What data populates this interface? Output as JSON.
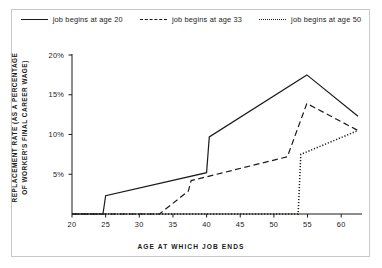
{
  "chart_data": {
    "type": "line",
    "title": "",
    "xlabel": "AGE AT WHICH JOB ENDS",
    "ylabel": "REPLACEMENT RATE (AS A PERCENTAGE OF WORKER'S FINAL CAREER WAGE)",
    "ylabel_line1": "REPLACEMENT RATE (AS A PERCENTAGE",
    "ylabel_line2": "OF WORKER'S FINAL CAREER WAGE)",
    "xlim": [
      20,
      62.5
    ],
    "ylim": [
      0,
      20
    ],
    "grid": false,
    "legend_position": "top-center",
    "xticks": [
      20,
      25,
      30,
      35,
      40,
      45,
      50,
      55,
      60
    ],
    "xtick_labels": [
      "20",
      "25",
      "30",
      "35",
      "40",
      "45",
      "50",
      "55",
      "60"
    ],
    "yticks": [
      5,
      10,
      15,
      20
    ],
    "ytick_labels": [
      "5%",
      "10%",
      "15%",
      "20%"
    ],
    "series": [
      {
        "name": "job begins at age 20",
        "style": "solid",
        "color": "#1a1a1a",
        "points": [
          [
            20,
            0
          ],
          [
            24.6,
            0
          ],
          [
            25.0,
            2.3
          ],
          [
            40.0,
            5.2
          ],
          [
            40.4,
            9.7
          ],
          [
            54.9,
            17.5
          ],
          [
            62.5,
            12.3
          ]
        ]
      },
      {
        "name": "job begins at age 33",
        "style": "dashed",
        "color": "#1a1a1a",
        "points": [
          [
            20,
            0
          ],
          [
            33.0,
            0
          ],
          [
            37.3,
            2.9
          ],
          [
            37.7,
            4.2
          ],
          [
            52.0,
            7.2
          ],
          [
            54.9,
            13.9
          ],
          [
            62.5,
            10.5
          ]
        ]
      },
      {
        "name": "job begins at age 50",
        "style": "dotted",
        "color": "#1a1a1a",
        "points": [
          [
            20,
            0
          ],
          [
            53.6,
            0
          ],
          [
            54.0,
            7.5
          ],
          [
            62.5,
            10.5
          ]
        ]
      }
    ]
  },
  "legend": {
    "items": [
      {
        "label": "job begins at age 20",
        "style": "solid"
      },
      {
        "label": "job begins at age 33",
        "style": "dashed"
      },
      {
        "label": "job begins at age 50",
        "style": "dotted"
      }
    ]
  },
  "colors": {
    "ink": "#1a1a1a",
    "axis": "#1a1a1a",
    "frame": "#c9c9c9",
    "background": "#ffffff"
  }
}
